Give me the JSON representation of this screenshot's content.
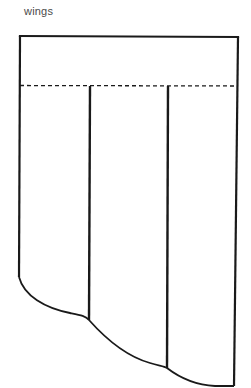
{
  "diagram": {
    "title": "wings",
    "colors": {
      "stroke": "#1a1a1a",
      "label": "#4a4a4a",
      "background": "#ffffff"
    },
    "parts": {
      "header_band": "rectangular top band above dashed fold line",
      "fold_line": "dashed",
      "panels": 3,
      "bottom_edge": "curved hem"
    }
  }
}
